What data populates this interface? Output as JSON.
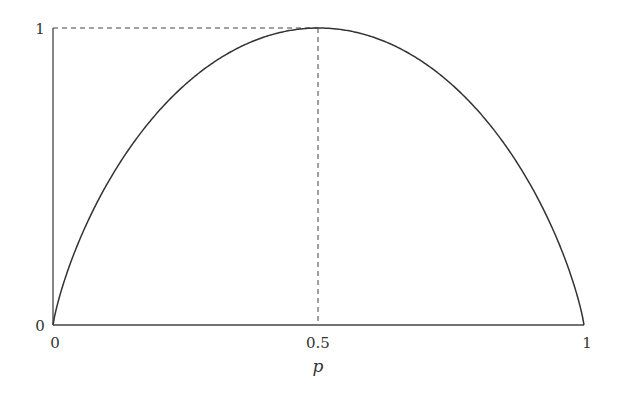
{
  "chart_data": {
    "type": "line",
    "title": "",
    "xlabel": "p",
    "ylabel": "",
    "xlim": [
      0,
      1
    ],
    "ylim": [
      0,
      1
    ],
    "grid": false,
    "legend": null,
    "x_ticks": [
      "0",
      "0.5",
      "1"
    ],
    "y_ticks": [
      "0",
      "1"
    ],
    "series": [
      {
        "name": "H(p) = -p log2 p - (1-p) log2 (1-p)",
        "x": [
          0,
          0.05,
          0.1,
          0.2,
          0.3,
          0.4,
          0.5,
          0.6,
          0.7,
          0.8,
          0.9,
          0.95,
          1
        ],
        "values": [
          0,
          0.286,
          0.469,
          0.722,
          0.881,
          0.971,
          1,
          0.971,
          0.881,
          0.722,
          0.469,
          0.286,
          0
        ]
      }
    ],
    "annotations": [
      {
        "type": "dashed-line",
        "from": [
          0,
          1
        ],
        "to": [
          0.5,
          1
        ]
      },
      {
        "type": "dashed-line",
        "from": [
          0.5,
          0
        ],
        "to": [
          0.5,
          1
        ]
      }
    ]
  },
  "labels": {
    "x0": "0",
    "x05": "0.5",
    "x1": "1",
    "y0": "0",
    "y1": "1",
    "xaxis": "p"
  }
}
